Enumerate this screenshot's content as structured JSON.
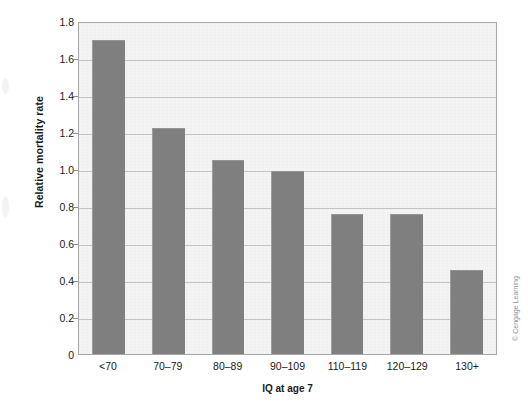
{
  "chart_data": {
    "type": "bar",
    "title": "",
    "subtitle": "",
    "xlabel": "IQ at age 7",
    "ylabel": "Relative mortality rate",
    "categories": [
      "<70",
      "70–79",
      "80–89",
      "90–109",
      "110–119",
      "120–129",
      "130+"
    ],
    "values": [
      1.7,
      1.22,
      1.05,
      0.99,
      0.755,
      0.755,
      0.455
    ],
    "ylim": [
      0,
      1.8
    ],
    "ytick_values": [
      0,
      0.2,
      0.4,
      0.6,
      0.8,
      1.0,
      1.2,
      1.4,
      1.6,
      1.8
    ],
    "ytick_labels": [
      "0",
      "0.2",
      "0.4",
      "0.6",
      "0.8",
      "1.0",
      "1.2",
      "1.4",
      "1.6",
      "1.8"
    ],
    "grid": true,
    "grid_axis": "y",
    "legend": false,
    "legend_position": "none",
    "bar_color": "#7f7f7f",
    "plot_background": "#f4f4f4",
    "gridline_color": "#c3c3c3",
    "axis_color": "#a8a8a8"
  },
  "credit": {
    "text": "© Cengage Learning"
  }
}
